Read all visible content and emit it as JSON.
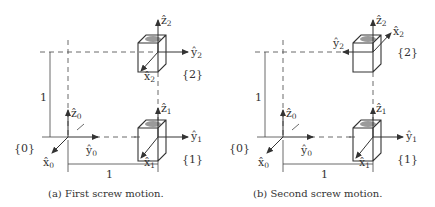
{
  "panels": [
    {
      "id": "a",
      "caption": "(a) First screw motion.",
      "frames": {
        "f0": {
          "label": "{0}",
          "x": "x̂",
          "x_sub": "0",
          "y": "ŷ",
          "y_sub": "0",
          "z": "ẑ",
          "z_sub": "0"
        },
        "f1": {
          "label": "{1}",
          "x": "x̂",
          "x_sub": "1",
          "y": "ŷ",
          "y_sub": "1",
          "z": "ẑ",
          "z_sub": "1"
        },
        "f2": {
          "label": "{2}",
          "x": "x̂",
          "x_sub": "2",
          "y": "ŷ",
          "y_sub": "2",
          "z": "ẑ",
          "z_sub": "2"
        }
      },
      "dim_vertical": "1",
      "dim_horizontal": "1",
      "frame2_y_direction": "right",
      "frame2_x_direction": "toward-viewer"
    },
    {
      "id": "b",
      "caption": "(b) Second screw motion.",
      "frames": {
        "f0": {
          "label": "{0}",
          "x": "x̂",
          "x_sub": "0",
          "y": "ŷ",
          "y_sub": "0",
          "z": "ẑ",
          "z_sub": "0"
        },
        "f1": {
          "label": "{1}",
          "x": "x̂",
          "x_sub": "1",
          "y": "ŷ",
          "y_sub": "1",
          "z": "ẑ",
          "z_sub": "1"
        },
        "f2": {
          "label": "{2}",
          "x": "x̂",
          "x_sub": "2",
          "y": "ŷ",
          "y_sub": "2",
          "z": "ẑ",
          "z_sub": "2"
        }
      },
      "dim_vertical": "1",
      "dim_horizontal": "1",
      "frame2_y_direction": "left",
      "frame2_x_direction": "away-from-viewer"
    }
  ],
  "colors": {
    "line": "#444444",
    "cube_top_shade": "#9a9a9a",
    "text": "#333333"
  }
}
